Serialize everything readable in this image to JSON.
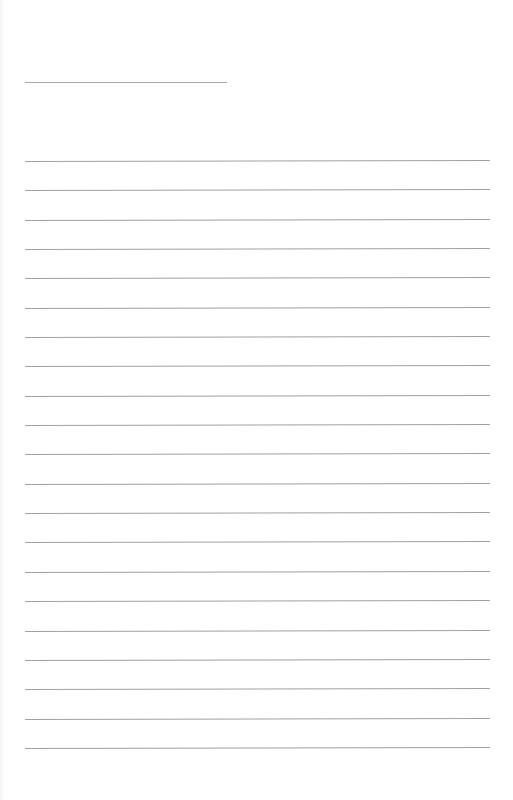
{
  "page": {
    "type": "blank lined writing sheet",
    "background_color": "#ffffff",
    "line_color": "#a0a0a0"
  },
  "title_line": {
    "x": 25,
    "y": 82,
    "width": 202
  },
  "ruled_lines": {
    "count": 21,
    "x": 25,
    "width": 465,
    "positions_y": [
      161,
      190,
      220,
      249,
      278,
      308,
      337,
      366,
      396,
      425,
      454,
      484,
      513,
      542,
      572,
      601,
      631,
      660,
      689,
      719,
      748
    ]
  }
}
